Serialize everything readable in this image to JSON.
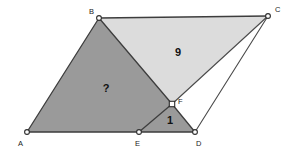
{
  "figure": {
    "type": "geometry-diagram",
    "canvas": {
      "width": 294,
      "height": 155
    },
    "background_color": "#ffffff",
    "colors": {
      "dark_gray_fill": "#9a9a9a",
      "light_gray_fill": "#dcdcdc",
      "white_fill": "#ffffff",
      "stroke": "#3d3d3d",
      "label_text": "#111111"
    },
    "points": [
      {
        "name": "A",
        "label": "A",
        "x": 27,
        "y": 132,
        "label_x": 18,
        "label_y": 146,
        "marker": "circle"
      },
      {
        "name": "B",
        "label": "B",
        "x": 99,
        "y": 18,
        "label_x": 89,
        "label_y": 14,
        "marker": "circle"
      },
      {
        "name": "C",
        "label": "C",
        "x": 268,
        "y": 16,
        "label_x": 275,
        "label_y": 12,
        "marker": "circle"
      },
      {
        "name": "D",
        "label": "D",
        "x": 195,
        "y": 132,
        "label_x": 196,
        "label_y": 146,
        "marker": "circle"
      },
      {
        "name": "E",
        "label": "E",
        "x": 139,
        "y": 132,
        "label_x": 135,
        "label_y": 146,
        "marker": "circle"
      },
      {
        "name": "F",
        "label": "F",
        "x": 172,
        "y": 104,
        "label_x": 178,
        "label_y": 104,
        "marker": "square"
      }
    ],
    "regions": [
      {
        "name": "quadrilateral-ABFE",
        "label": "?",
        "label_x": 106,
        "label_y": 92,
        "fill": "#9a9a9a",
        "vertices": "A,B,F,E"
      },
      {
        "name": "triangle-BCF",
        "label": "9",
        "label_x": 178,
        "label_y": 56,
        "fill": "#dcdcdc",
        "vertices": "B,C,F"
      },
      {
        "name": "triangle-EFD",
        "label": "1",
        "label_x": 170,
        "label_y": 124,
        "fill": "#9a9a9a",
        "vertices": "E,F,D"
      },
      {
        "name": "triangle-FDC",
        "label": "",
        "label_x": 0,
        "label_y": 0,
        "fill": "#ffffff",
        "vertices": "F,D,C"
      }
    ],
    "edges": [
      {
        "name": "edge-A-B",
        "from": "A",
        "to": "B"
      },
      {
        "name": "edge-B-C",
        "from": "B",
        "to": "C"
      },
      {
        "name": "edge-A-E",
        "from": "A",
        "to": "E"
      },
      {
        "name": "edge-E-D",
        "from": "E",
        "to": "D"
      },
      {
        "name": "edge-D-C",
        "from": "D",
        "to": "C"
      },
      {
        "name": "edge-B-F",
        "from": "B",
        "to": "F"
      },
      {
        "name": "edge-F-E",
        "from": "F",
        "to": "E"
      },
      {
        "name": "edge-F-D",
        "from": "F",
        "to": "D"
      },
      {
        "name": "edge-F-C",
        "from": "F",
        "to": "C"
      }
    ],
    "labels": {
      "area_unknown": "?",
      "area_nine": "9",
      "area_one": "1"
    }
  }
}
